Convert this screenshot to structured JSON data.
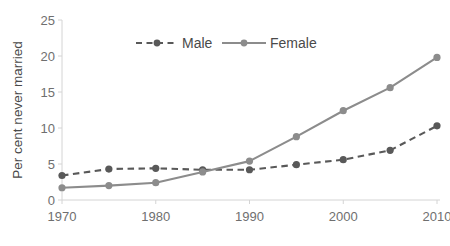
{
  "chart_data": {
    "type": "line",
    "title": "",
    "subtitle": "",
    "xlabel": "",
    "ylabel": "Per cent never married",
    "x": [
      1970,
      1975,
      1980,
      1985,
      1990,
      1995,
      2000,
      2005,
      2010
    ],
    "xtick_labels": [
      "1970",
      "1980",
      "1990",
      "2000",
      "2010"
    ],
    "xtick_values": [
      1970,
      1980,
      1990,
      2000,
      2010
    ],
    "xlim": [
      1970,
      2010
    ],
    "ytick_labels": [
      "0",
      "5",
      "10",
      "15",
      "20",
      "25"
    ],
    "ytick_values": [
      0,
      5,
      10,
      15,
      20,
      25
    ],
    "ylim": [
      0,
      25
    ],
    "grid": false,
    "legend_position": "top-center",
    "series": [
      {
        "name": "Male",
        "color": "#595959",
        "line_style": "dashed",
        "marker": "circle",
        "values": [
          3.4,
          4.3,
          4.4,
          4.2,
          4.2,
          4.9,
          5.6,
          6.9,
          10.3
        ]
      },
      {
        "name": "Female",
        "color": "#8c8c8c",
        "line_style": "solid",
        "marker": "circle",
        "values": [
          1.7,
          2.0,
          2.4,
          3.9,
          5.4,
          8.8,
          12.4,
          15.6,
          19.8
        ]
      }
    ]
  },
  "legend": {
    "items": [
      {
        "label": "Male"
      },
      {
        "label": "Female"
      }
    ]
  },
  "colors": {
    "male": "#595959",
    "female": "#8c8c8c",
    "axis": "#d4d4d4",
    "tick_text": "#6f6f6f",
    "axis_title_text": "#4a4a4a",
    "background": "#ffffff"
  }
}
